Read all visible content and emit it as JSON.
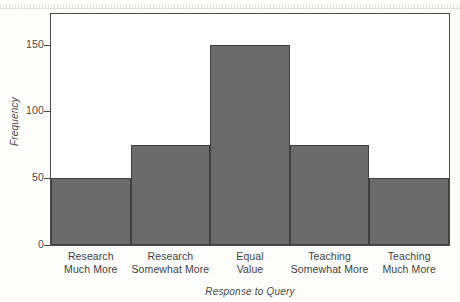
{
  "chart_data": {
    "type": "bar",
    "title": "",
    "subtitle": "",
    "xlabel": "Response to Query",
    "ylabel": "Frequency",
    "categories": [
      "Research Much More",
      "Research Somewhat More",
      "Equal Value",
      "Teaching Somewhat More",
      "Teaching Much More"
    ],
    "category_lines": [
      [
        "Research",
        "Much More"
      ],
      [
        "Research",
        "Somewhat More"
      ],
      [
        "Equal",
        "Value"
      ],
      [
        "Teaching",
        "Somewhat More"
      ],
      [
        "Teaching",
        "Much More"
      ]
    ],
    "values": [
      50,
      75,
      150,
      75,
      50
    ],
    "ylim": [
      0,
      173
    ],
    "yticks": [
      0,
      50,
      100,
      150
    ],
    "ytick_labels": [
      "0",
      "50",
      "100",
      "150"
    ],
    "grid": false,
    "legend": "none",
    "bar_color": "#6b6b6b",
    "bar_edge_color": "#3f3f3f",
    "axis_color": "#4a4a4a",
    "plot_background": "#ffffff",
    "page_background": "#fdfdfb"
  }
}
